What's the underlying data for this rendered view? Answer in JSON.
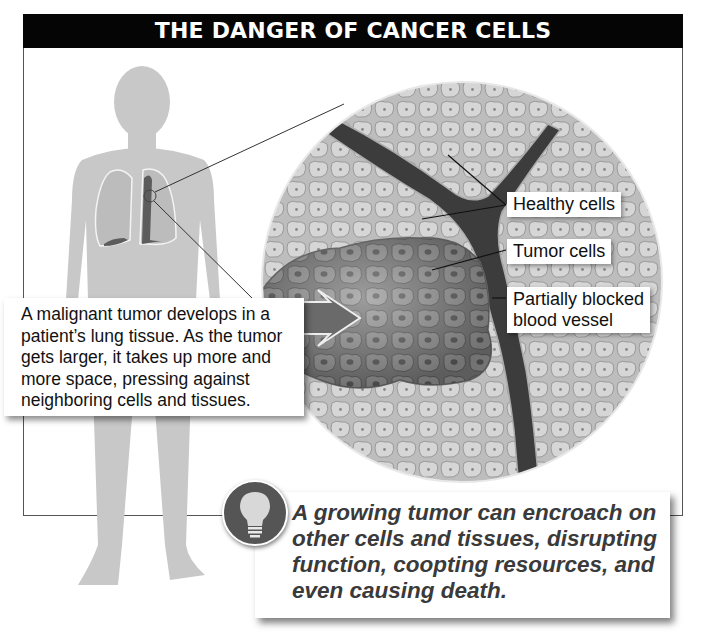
{
  "title": "THE DANGER OF CANCER CELLS",
  "labels": {
    "healthy_cells": "Healthy cells",
    "tumor_cells": "Tumor cells",
    "blocked_vessel_line1": "Partially blocked",
    "blocked_vessel_line2": "blood vessel"
  },
  "callout": {
    "lines": [
      "A malignant tumor develops in a",
      "patient’s lung tissue. As the tumor",
      "gets larger, it takes up more and",
      "more space, pressing against",
      "neighboring cells and tissues."
    ]
  },
  "insight": {
    "icon": "lightbulb-icon",
    "lines": [
      "A growing tumor can encroach on",
      "other cells and tissues, disrupting",
      "function, coopting resources, and",
      "even causing death."
    ]
  },
  "colors": {
    "title_bg": "#050505",
    "body_silhouette": "#c8c8c8",
    "cell_fill": "#d2d2d2",
    "vessel": "#3a3a3a",
    "tumor": "#8a8a8a"
  }
}
